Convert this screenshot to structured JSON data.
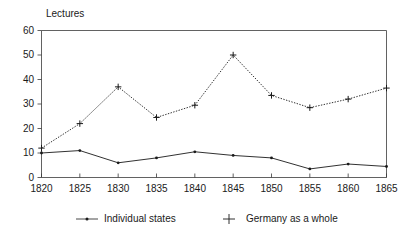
{
  "chart_data": {
    "type": "line",
    "title": "",
    "ylabel": "Lectures",
    "xlabel": "",
    "x": [
      1820,
      1825,
      1830,
      1835,
      1840,
      1845,
      1850,
      1855,
      1860,
      1865
    ],
    "categories": [
      "1820",
      "1825",
      "1830",
      "1835",
      "1840",
      "1845",
      "1850",
      "1855",
      "1860",
      "1865"
    ],
    "xlim": [
      1820,
      1865
    ],
    "ylim": [
      0,
      60
    ],
    "yticks": [
      0,
      10,
      20,
      30,
      40,
      50,
      60
    ],
    "ytick_labels": [
      "0",
      "10",
      "20",
      "30",
      "40",
      "50",
      "60"
    ],
    "grid": false,
    "legend_position": "bottom",
    "series": [
      {
        "name": "Individual states",
        "marker": "dot",
        "linestyle": "solid",
        "color": "#1a1a1a",
        "values": [
          10,
          11,
          6,
          8,
          10.5,
          9,
          8,
          3.5,
          5.5,
          4.5
        ]
      },
      {
        "name": "Germany as a whole",
        "marker": "plus",
        "linestyle": "dotted",
        "color": "#1a1a1a",
        "values": [
          12,
          22,
          37,
          24.5,
          29.5,
          50,
          33.5,
          28.5,
          32,
          36.5
        ]
      }
    ]
  },
  "legend": {
    "entries": [
      {
        "label": "Individual states"
      },
      {
        "label": "Germany as a whole"
      }
    ]
  }
}
